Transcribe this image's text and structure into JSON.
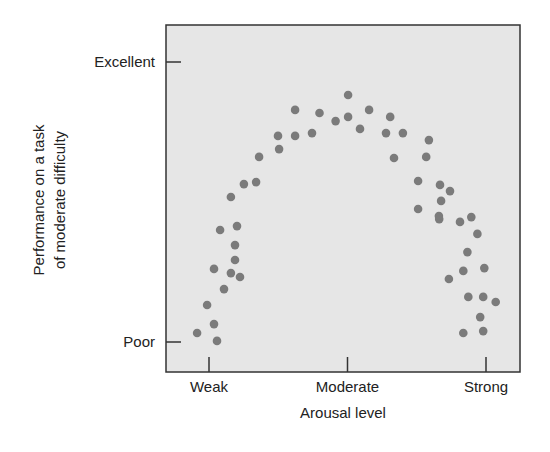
{
  "chart_data": {
    "type": "scatter",
    "title": "",
    "xlabel": "Arousal level",
    "ylabel_lines": [
      "Performance on a task",
      "of moderate difficulty"
    ],
    "ylabel": "Performance on a task of moderate difficulty",
    "x_ticks": [
      {
        "value": 0,
        "label": "Weak"
      },
      {
        "value": 5,
        "label": "Moderate"
      },
      {
        "value": 10,
        "label": "Strong"
      }
    ],
    "y_ticks": [
      {
        "value": 0,
        "label": "Poor"
      },
      {
        "value": 10,
        "label": "Excellent"
      }
    ],
    "xlim": [
      -1.55,
      11.2
    ],
    "ylim": [
      -1.07,
      11.36
    ],
    "grid": false,
    "legend": null,
    "colors": {
      "plot_background": "#e6e6e6",
      "point": "#7b7b7b",
      "axis": "#333333"
    },
    "points": [
      [
        -0.43,
        0.32
      ],
      [
        -0.07,
        1.32
      ],
      [
        0.18,
        0.64
      ],
      [
        0.29,
        0.04
      ],
      [
        0.18,
        2.61
      ],
      [
        0.54,
        1.89
      ],
      [
        0.4,
        4.0
      ],
      [
        0.79,
        2.46
      ],
      [
        1.12,
        2.32
      ],
      [
        0.94,
        2.93
      ],
      [
        0.94,
        3.46
      ],
      [
        0.79,
        5.18
      ],
      [
        1.01,
        4.14
      ],
      [
        1.7,
        5.71
      ],
      [
        1.26,
        5.64
      ],
      [
        1.81,
        6.61
      ],
      [
        2.53,
        6.89
      ],
      [
        2.49,
        7.36
      ],
      [
        3.11,
        7.36
      ],
      [
        3.11,
        8.29
      ],
      [
        3.72,
        7.46
      ],
      [
        3.99,
        8.18
      ],
      [
        4.57,
        7.89
      ],
      [
        5.02,
        8.82
      ],
      [
        5.02,
        8.04
      ],
      [
        5.45,
        7.61
      ],
      [
        5.78,
        8.29
      ],
      [
        6.54,
        8.04
      ],
      [
        6.39,
        7.46
      ],
      [
        7.0,
        7.46
      ],
      [
        6.68,
        6.57
      ],
      [
        7.94,
        7.21
      ],
      [
        7.84,
        6.61
      ],
      [
        7.55,
        5.75
      ],
      [
        8.34,
        5.61
      ],
      [
        8.7,
        5.39
      ],
      [
        8.38,
        5.04
      ],
      [
        7.55,
        4.75
      ],
      [
        8.31,
        4.39
      ],
      [
        9.47,
        4.46
      ],
      [
        8.3,
        4.5
      ],
      [
        9.06,
        4.29
      ],
      [
        9.69,
        3.86
      ],
      [
        9.33,
        3.21
      ],
      [
        9.18,
        2.54
      ],
      [
        9.94,
        2.64
      ],
      [
        8.66,
        2.25
      ],
      [
        9.36,
        1.61
      ],
      [
        9.9,
        1.61
      ],
      [
        10.35,
        1.43
      ],
      [
        9.79,
        0.89
      ],
      [
        9.18,
        0.32
      ],
      [
        9.9,
        0.39
      ]
    ]
  }
}
